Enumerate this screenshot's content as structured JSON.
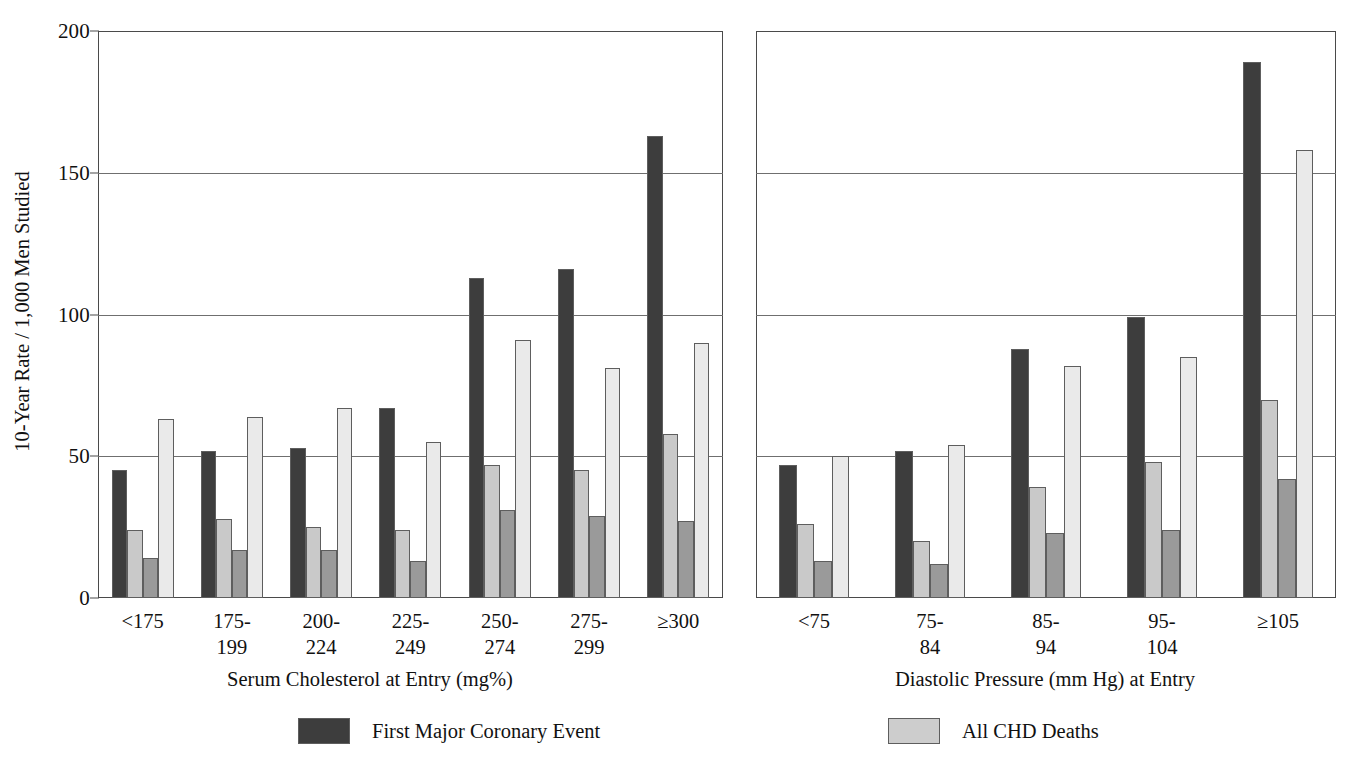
{
  "axis": {
    "ylabel": "10-Year Rate / 1,000 Men Studied",
    "yticks": [
      "0",
      "50",
      "100",
      "150",
      "200"
    ]
  },
  "legend": {
    "items": [
      {
        "label": "First Major Coronary Event",
        "color": "#3d3d3d"
      },
      {
        "label": "All CHD Deaths",
        "color": "#cdcdcd"
      }
    ]
  },
  "panels": [
    {
      "id": "cholesterol",
      "xtitle": "Serum Cholesterol at Entry (mg%)",
      "categories": [
        "<175",
        "175-\n199",
        "200-\n224",
        "225-\n249",
        "250-\n274",
        "275-\n299",
        "≥300"
      ]
    },
    {
      "id": "diastolic",
      "xtitle": "Diastolic Pressure (mm Hg) at Entry",
      "categories": [
        "<75",
        "75-\n84",
        "85-\n94",
        "95-\n104",
        "≥105"
      ]
    }
  ],
  "chart_data": [
    {
      "type": "bar",
      "title": "",
      "xlabel": "Serum Cholesterol at Entry (mg%)",
      "ylabel": "10-Year Rate / 1,000 Men Studied",
      "ylim": [
        0,
        200
      ],
      "yticks": [
        0,
        50,
        100,
        150,
        200
      ],
      "grid": true,
      "legend_position": "bottom",
      "categories": [
        "<175",
        "175-199",
        "200-224",
        "225-249",
        "250-274",
        "275-299",
        "≥300"
      ],
      "series": [
        {
          "name": "First Major Coronary Event",
          "color": "#3d3d3d",
          "values": [
            45,
            52,
            53,
            67,
            113,
            116,
            163
          ]
        },
        {
          "name": "series-2",
          "color": "#c9c9c9",
          "values": [
            24,
            28,
            25,
            24,
            47,
            45,
            58
          ]
        },
        {
          "name": "series-3",
          "color": "#9a9a9a",
          "values": [
            14,
            17,
            17,
            13,
            31,
            29,
            27
          ]
        },
        {
          "name": "All CHD Deaths",
          "color": "#eaeaea",
          "values": [
            63,
            64,
            67,
            55,
            91,
            81,
            90
          ]
        }
      ]
    },
    {
      "type": "bar",
      "title": "",
      "xlabel": "Diastolic Pressure (mm Hg) at Entry",
      "ylabel": "10-Year Rate / 1,000 Men Studied",
      "ylim": [
        0,
        200
      ],
      "yticks": [
        0,
        50,
        100,
        150,
        200
      ],
      "grid": true,
      "legend_position": "bottom",
      "categories": [
        "<75",
        "75-84",
        "85-94",
        "95-104",
        "≥105"
      ],
      "series": [
        {
          "name": "First Major Coronary Event",
          "color": "#3d3d3d",
          "values": [
            47,
            52,
            88,
            99,
            189
          ]
        },
        {
          "name": "series-2",
          "color": "#c9c9c9",
          "values": [
            26,
            20,
            39,
            48,
            70
          ]
        },
        {
          "name": "series-3",
          "color": "#9a9a9a",
          "values": [
            13,
            12,
            23,
            24,
            42
          ]
        },
        {
          "name": "All CHD Deaths",
          "color": "#eaeaea",
          "values": [
            50,
            54,
            82,
            85,
            158
          ]
        }
      ]
    }
  ]
}
